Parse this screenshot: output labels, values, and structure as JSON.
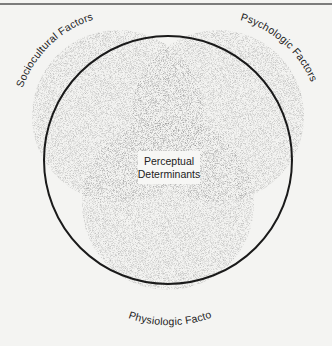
{
  "diagram": {
    "type": "venn",
    "center_label": {
      "line1": "Perceptual",
      "line2": "Determinants"
    },
    "sets": [
      {
        "id": "sociocultural",
        "label": "Sociocultural Factors",
        "position": "upper-left"
      },
      {
        "id": "psychologic",
        "label": "Psychologic Factors",
        "position": "upper-right"
      },
      {
        "id": "physiologic",
        "label": "Physiologic Factors",
        "position": "bottom"
      }
    ],
    "outer_circle": "enclosing outline",
    "colors": {
      "background": "#f4f4f2",
      "stipple": "#333333",
      "outline": "#1a1a1a"
    }
  }
}
